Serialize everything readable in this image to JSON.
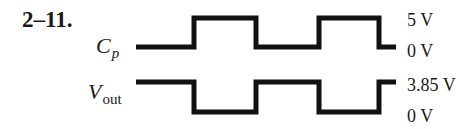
{
  "figure": {
    "problem_number": "2–11.",
    "signals": [
      {
        "id": "cp",
        "label_main": "C",
        "label_sub": "p",
        "high_label": "5 V",
        "low_label": "0 V",
        "pattern": "low-high-low-high-low",
        "stroke_color": "#111111"
      },
      {
        "id": "vout",
        "label_main": "V",
        "label_sub": "out",
        "high_label": "3.85 V",
        "low_label": "0 V",
        "pattern": "high-low-high-low-high",
        "stroke_color": "#111111"
      }
    ]
  }
}
